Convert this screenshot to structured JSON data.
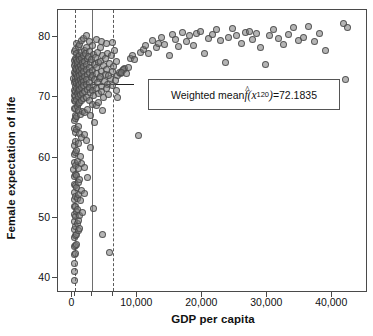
{
  "chart_data": {
    "type": "scatter",
    "title": "",
    "xlabel": "GDP per capita",
    "ylabel": "Female expectation of life",
    "xlim": [
      -2200,
      45500
    ],
    "ylim": [
      37.5,
      84.5
    ],
    "xticks": [
      0,
      10000,
      20000,
      30000,
      40000
    ],
    "xtick_labels": [
      "0",
      "10,000",
      "20,000",
      "30,000",
      "40,000"
    ],
    "yticks": [
      40,
      50,
      60,
      70,
      80
    ],
    "ytick_labels": [
      "40",
      "50",
      "60",
      "70",
      "80"
    ],
    "grid": false,
    "legend": "none",
    "marker": {
      "shape": "circle",
      "fill_color": "#787878",
      "fill_opacity": 0.55,
      "edge_color": "#464646",
      "size_px": 7
    },
    "reference_lines": [
      {
        "name": "bandwidth-lower",
        "orientation": "vertical",
        "x": 450,
        "style": "dashed",
        "color": "#5a5a5a"
      },
      {
        "name": "evaluation-point-x120",
        "orientation": "vertical",
        "x": 3000,
        "style": "solid",
        "color": "#6e6e6e"
      },
      {
        "name": "bandwidth-upper",
        "orientation": "vertical",
        "x": 6200,
        "style": "dashed",
        "color": "#5a5a5a"
      },
      {
        "name": "weighted-mean-level",
        "orientation": "horizontal",
        "y": 72.1835,
        "x_start": 150,
        "x_end": 9500,
        "style": "solid",
        "color": "#222222"
      }
    ],
    "annotation": {
      "prefix": "Weighted mean ",
      "symbol": "f",
      "hat": "^",
      "arg_open": "(x",
      "arg_sub": "120",
      "arg_close": ")",
      "equals": " = ",
      "value": "72.1835",
      "full_text": "Weighted mean f̂(x120) = 72.1835"
    },
    "points": [
      [
        340,
        77.6
      ],
      [
        360,
        76.1
      ],
      [
        290,
        75.3
      ],
      [
        410,
        74.2
      ],
      [
        250,
        73.1
      ],
      [
        300,
        72.4
      ],
      [
        380,
        71.2
      ],
      [
        330,
        70.3
      ],
      [
        270,
        69.4
      ],
      [
        360,
        68.1
      ],
      [
        420,
        67.0
      ],
      [
        310,
        66.2
      ],
      [
        280,
        64.8
      ],
      [
        350,
        62.0
      ],
      [
        300,
        60.5
      ],
      [
        330,
        59.1
      ],
      [
        260,
        58.0
      ],
      [
        390,
        56.8
      ],
      [
        320,
        55.5
      ],
      [
        300,
        54.2
      ],
      [
        340,
        53.0
      ],
      [
        280,
        51.8
      ],
      [
        310,
        50.6
      ],
      [
        360,
        49.4
      ],
      [
        290,
        48.1
      ],
      [
        330,
        46.8
      ],
      [
        300,
        45.2
      ],
      [
        350,
        43.9
      ],
      [
        310,
        42.4
      ],
      [
        330,
        41.0
      ],
      [
        300,
        39.5
      ],
      [
        480,
        78.0
      ],
      [
        520,
        76.4
      ],
      [
        460,
        75.6
      ],
      [
        540,
        74.8
      ],
      [
        500,
        73.9
      ],
      [
        470,
        73.2
      ],
      [
        560,
        72.6
      ],
      [
        510,
        71.8
      ],
      [
        490,
        71.0
      ],
      [
        530,
        70.2
      ],
      [
        470,
        69.3
      ],
      [
        550,
        68.2
      ],
      [
        500,
        66.5
      ],
      [
        520,
        64.2
      ],
      [
        480,
        62.6
      ],
      [
        540,
        60.8
      ],
      [
        510,
        58.6
      ],
      [
        470,
        57.2
      ],
      [
        530,
        55.4
      ],
      [
        500,
        53.6
      ],
      [
        560,
        51.9
      ],
      [
        490,
        50.2
      ],
      [
        520,
        48.6
      ],
      [
        480,
        47.0
      ],
      [
        540,
        45.4
      ],
      [
        510,
        44.0
      ],
      [
        680,
        79.0
      ],
      [
        720,
        77.2
      ],
      [
        660,
        76.3
      ],
      [
        740,
        75.4
      ],
      [
        700,
        74.6
      ],
      [
        670,
        73.8
      ],
      [
        760,
        73.1
      ],
      [
        710,
        72.3
      ],
      [
        690,
        71.5
      ],
      [
        730,
        70.6
      ],
      [
        680,
        69.6
      ],
      [
        750,
        68.4
      ],
      [
        700,
        66.8
      ],
      [
        720,
        64.6
      ],
      [
        690,
        61.2
      ],
      [
        740,
        59.4
      ],
      [
        710,
        57.0
      ],
      [
        670,
        55.0
      ],
      [
        730,
        53.2
      ],
      [
        700,
        51.0
      ],
      [
        760,
        49.0
      ],
      [
        690,
        47.2
      ],
      [
        720,
        45.6
      ],
      [
        880,
        78.4
      ],
      [
        920,
        76.8
      ],
      [
        860,
        75.9
      ],
      [
        940,
        75.0
      ],
      [
        900,
        74.2
      ],
      [
        870,
        73.4
      ],
      [
        960,
        72.7
      ],
      [
        910,
        71.9
      ],
      [
        890,
        71.1
      ],
      [
        930,
        70.1
      ],
      [
        880,
        69.0
      ],
      [
        950,
        67.8
      ],
      [
        900,
        65.2
      ],
      [
        920,
        62.4
      ],
      [
        890,
        58.2
      ],
      [
        940,
        55.8
      ],
      [
        910,
        53.8
      ],
      [
        870,
        51.4
      ],
      [
        930,
        49.6
      ],
      [
        900,
        47.8
      ],
      [
        1120,
        78.8
      ],
      [
        1180,
        77.0
      ],
      [
        1080,
        76.2
      ],
      [
        1220,
        75.3
      ],
      [
        1140,
        74.5
      ],
      [
        1100,
        73.6
      ],
      [
        1250,
        72.9
      ],
      [
        1160,
        72.1
      ],
      [
        1110,
        71.3
      ],
      [
        1200,
        70.4
      ],
      [
        1130,
        69.2
      ],
      [
        1230,
        67.2
      ],
      [
        1150,
        64.0
      ],
      [
        1190,
        60.2
      ],
      [
        1170,
        56.4
      ],
      [
        1210,
        52.8
      ],
      [
        1140,
        50.4
      ],
      [
        1180,
        48.2
      ],
      [
        1420,
        79.4
      ],
      [
        1480,
        77.4
      ],
      [
        1380,
        76.5
      ],
      [
        1520,
        75.7
      ],
      [
        1440,
        74.8
      ],
      [
        1400,
        73.9
      ],
      [
        1560,
        73.2
      ],
      [
        1460,
        72.4
      ],
      [
        1410,
        71.6
      ],
      [
        1500,
        70.7
      ],
      [
        1430,
        69.5
      ],
      [
        1530,
        67.6
      ],
      [
        1450,
        63.4
      ],
      [
        1490,
        59.0
      ],
      [
        1470,
        54.6
      ],
      [
        1510,
        50.8
      ],
      [
        1750,
        79.8
      ],
      [
        1820,
        77.8
      ],
      [
        1700,
        76.9
      ],
      [
        1880,
        76.0
      ],
      [
        1780,
        75.1
      ],
      [
        1720,
        74.3
      ],
      [
        1920,
        73.5
      ],
      [
        1800,
        72.7
      ],
      [
        1740,
        71.9
      ],
      [
        1860,
        71.0
      ],
      [
        1760,
        69.8
      ],
      [
        1890,
        67.4
      ],
      [
        1810,
        63.8
      ],
      [
        1850,
        58.4
      ],
      [
        1830,
        54.0
      ],
      [
        2150,
        80.2
      ],
      [
        2250,
        78.2
      ],
      [
        2080,
        77.3
      ],
      [
        2320,
        76.4
      ],
      [
        2180,
        75.5
      ],
      [
        2110,
        74.6
      ],
      [
        2380,
        73.8
      ],
      [
        2210,
        73.0
      ],
      [
        2140,
        72.2
      ],
      [
        2290,
        71.3
      ],
      [
        2160,
        70.0
      ],
      [
        2340,
        67.9
      ],
      [
        2230,
        62.8
      ],
      [
        2300,
        56.6
      ],
      [
        2600,
        79.2
      ],
      [
        2720,
        77.6
      ],
      [
        2550,
        76.7
      ],
      [
        2820,
        75.8
      ],
      [
        2650,
        74.9
      ],
      [
        2580,
        74.1
      ],
      [
        2880,
        73.3
      ],
      [
        2700,
        72.5
      ],
      [
        2620,
        71.7
      ],
      [
        2780,
        70.8
      ],
      [
        2660,
        69.4
      ],
      [
        2840,
        66.9
      ],
      [
        2740,
        61.6
      ],
      [
        3100,
        78.6
      ],
      [
        3250,
        77.1
      ],
      [
        3020,
        76.2
      ],
      [
        3380,
        75.4
      ],
      [
        3160,
        74.5
      ],
      [
        3060,
        73.7
      ],
      [
        3440,
        72.9
      ],
      [
        3220,
        72.0
      ],
      [
        3120,
        71.2
      ],
      [
        3320,
        70.3
      ],
      [
        3180,
        68.8
      ],
      [
        3400,
        65.8
      ],
      [
        3280,
        51.6
      ],
      [
        3700,
        79.6
      ],
      [
        3880,
        77.5
      ],
      [
        3620,
        76.6
      ],
      [
        4020,
        75.8
      ],
      [
        3780,
        74.9
      ],
      [
        3680,
        74.0
      ],
      [
        4120,
        73.2
      ],
      [
        3840,
        72.4
      ],
      [
        3720,
        71.5
      ],
      [
        3960,
        70.6
      ],
      [
        3800,
        68.6
      ],
      [
        4080,
        69.2
      ],
      [
        4400,
        78.2
      ],
      [
        4600,
        76.9
      ],
      [
        4320,
        76.0
      ],
      [
        4820,
        75.2
      ],
      [
        4500,
        74.3
      ],
      [
        4380,
        73.5
      ],
      [
        4920,
        72.7
      ],
      [
        4560,
        71.8
      ],
      [
        4420,
        71.0
      ],
      [
        4760,
        70.0
      ],
      [
        4620,
        67.8
      ],
      [
        4700,
        47.2
      ],
      [
        4480,
        79.2
      ],
      [
        5200,
        78.9
      ],
      [
        5450,
        77.3
      ],
      [
        5080,
        76.4
      ],
      [
        5700,
        75.6
      ],
      [
        5320,
        74.7
      ],
      [
        5150,
        73.8
      ],
      [
        5880,
        73.1
      ],
      [
        5400,
        72.2
      ],
      [
        5220,
        71.4
      ],
      [
        5620,
        70.5
      ],
      [
        5500,
        73.6
      ],
      [
        5700,
        44.2
      ],
      [
        6200,
        79.1
      ],
      [
        6500,
        77.8
      ],
      [
        6050,
        76.9
      ],
      [
        6850,
        76.0
      ],
      [
        6350,
        75.1
      ],
      [
        6150,
        74.3
      ],
      [
        7000,
        73.6
      ],
      [
        6600,
        72.8
      ],
      [
        6250,
        72.0
      ],
      [
        6750,
        71.2
      ],
      [
        6900,
        69.9
      ],
      [
        7400,
        74.0
      ],
      [
        7700,
        74.4
      ],
      [
        7200,
        74.1
      ],
      [
        8100,
        74.8
      ],
      [
        7900,
        74.6
      ],
      [
        7550,
        74.2
      ],
      [
        8300,
        73.9
      ],
      [
        8600,
        75.0
      ],
      [
        8900,
        76.4
      ],
      [
        9200,
        77.0
      ],
      [
        9600,
        76.2
      ],
      [
        10200,
        63.6
      ],
      [
        10500,
        77.4
      ],
      [
        10900,
        78.0
      ],
      [
        11300,
        78.6
      ],
      [
        11800,
        77.2
      ],
      [
        12400,
        79.4
      ],
      [
        12900,
        78.2
      ],
      [
        13300,
        79.0
      ],
      [
        13800,
        80.0
      ],
      [
        14200,
        78.8
      ],
      [
        14900,
        77.0
      ],
      [
        15400,
        80.4
      ],
      [
        15900,
        79.6
      ],
      [
        16400,
        78.4
      ],
      [
        16900,
        80.8
      ],
      [
        17500,
        79.2
      ],
      [
        18100,
        80.2
      ],
      [
        18600,
        78.6
      ],
      [
        19100,
        80.6
      ],
      [
        19700,
        81.0
      ],
      [
        20400,
        77.2
      ],
      [
        21000,
        79.8
      ],
      [
        21600,
        80.4
      ],
      [
        22200,
        81.2
      ],
      [
        22800,
        79.4
      ],
      [
        23500,
        75.8
      ],
      [
        24100,
        80.0
      ],
      [
        24700,
        81.4
      ],
      [
        25300,
        80.2
      ],
      [
        26000,
        79.0
      ],
      [
        26600,
        80.8
      ],
      [
        27200,
        81.0
      ],
      [
        27800,
        79.6
      ],
      [
        28400,
        80.6
      ],
      [
        29000,
        78.2
      ],
      [
        29700,
        75.4
      ],
      [
        30400,
        80.2
      ],
      [
        31000,
        81.2
      ],
      [
        31700,
        79.8
      ],
      [
        32500,
        78.8
      ],
      [
        33200,
        80.4
      ],
      [
        34000,
        81.6
      ],
      [
        34800,
        79.4
      ],
      [
        35600,
        80.0
      ],
      [
        36400,
        81.8
      ],
      [
        37200,
        79.2
      ],
      [
        38000,
        80.6
      ],
      [
        38900,
        77.8
      ],
      [
        41800,
        82.2
      ],
      [
        42400,
        81.6
      ],
      [
        42000,
        73.0
      ]
    ]
  }
}
